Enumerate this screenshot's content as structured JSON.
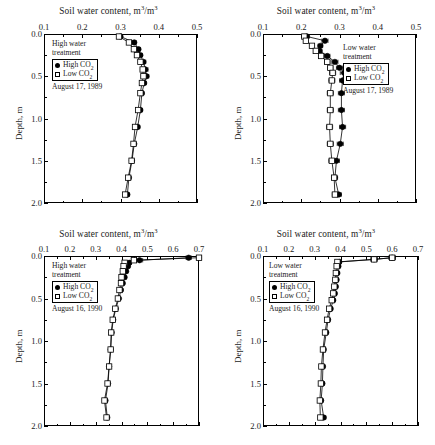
{
  "figure": {
    "axis_title": "Soil water content, m3/m3",
    "axis_title_prefix": "Soil water content, m",
    "axis_title_mid": "/m",
    "superscript": "3",
    "y_axis_label": "Depth, m",
    "legend_high": "High CO",
    "legend_low": "Low CO",
    "legend_sub": "2"
  },
  "chart_data": [
    {
      "type": "line",
      "panel": "top-left",
      "title": "Soil water content, m3/m3",
      "xlabel": "Soil water content, m3/m3",
      "ylabel": "Depth, m",
      "xlim": [
        0.1,
        0.5
      ],
      "ylim": [
        0.0,
        2.0
      ],
      "xticks": [
        0.1,
        0.2,
        0.3,
        0.4,
        0.5
      ],
      "xtick_labels": [
        "0.1",
        "0.2",
        "0.3",
        "0.4",
        "0.5"
      ],
      "yticks": [
        0.0,
        0.5,
        1.0,
        1.5,
        2.0
      ],
      "ytick_labels": [
        "0.0",
        "0.5",
        "1.0",
        "1.5",
        "2.0"
      ],
      "minor_xticks": [
        0.15,
        0.25,
        0.35,
        0.45
      ],
      "minor_yticks": [
        0.25,
        0.75,
        1.25,
        1.75
      ],
      "grid": false,
      "y_inverted": true,
      "annotations": [
        "High water treatment",
        "August 17, 1989"
      ],
      "treatment": "High water treatment",
      "date": "August 17, 1989",
      "series": [
        {
          "name": "High CO2",
          "marker": "filled-circle",
          "depths": [
            0.03,
            0.1,
            0.18,
            0.25,
            0.33,
            0.42,
            0.5,
            0.58,
            0.7,
            0.9,
            1.1,
            1.3,
            1.5,
            1.7,
            1.9
          ],
          "values": [
            0.3,
            0.336,
            0.347,
            0.352,
            0.36,
            0.365,
            0.368,
            0.362,
            0.356,
            0.352,
            0.345,
            0.336,
            0.33,
            0.322,
            0.318
          ],
          "xerr": [
            0.004,
            0.005,
            0.005,
            0.005,
            0.006,
            0.007,
            0.006,
            0.005,
            0.005,
            0.005,
            0.005,
            0.005,
            0.006,
            0.005,
            0.005
          ]
        },
        {
          "name": "Low CO2",
          "marker": "open-square",
          "depths": [
            0.03,
            0.1,
            0.18,
            0.25,
            0.33,
            0.42,
            0.5,
            0.58,
            0.7,
            0.9,
            1.1,
            1.3,
            1.5,
            1.7,
            1.9
          ],
          "values": [
            0.296,
            0.322,
            0.335,
            0.343,
            0.352,
            0.358,
            0.36,
            0.356,
            0.352,
            0.346,
            0.338,
            0.334,
            0.329,
            0.32,
            0.312
          ],
          "xerr": [
            0.004,
            0.005,
            0.005,
            0.005,
            0.005,
            0.006,
            0.006,
            0.005,
            0.005,
            0.005,
            0.005,
            0.005,
            0.005,
            0.005,
            0.005
          ]
        }
      ]
    },
    {
      "type": "line",
      "panel": "top-right",
      "title": "Soil water content, m3/m3",
      "xlabel": "Soil water content, m3/m3",
      "ylabel": "Depth, m",
      "xlim": [
        0.1,
        0.5
      ],
      "ylim": [
        0.0,
        2.0
      ],
      "xticks": [
        0.1,
        0.2,
        0.3,
        0.4,
        0.5
      ],
      "xtick_labels": [
        "0.1",
        "0.2",
        "0.3",
        "0.4",
        "0.5"
      ],
      "yticks": [
        0.0,
        0.5,
        1.0,
        1.5,
        2.0
      ],
      "ytick_labels": [
        "0.0",
        "0.5",
        "1.0",
        "1.5",
        "2.0"
      ],
      "minor_xticks": [
        0.15,
        0.25,
        0.35,
        0.45
      ],
      "minor_yticks": [
        0.25,
        0.75,
        1.25,
        1.75
      ],
      "grid": false,
      "y_inverted": true,
      "annotations": [
        "Low water treatment",
        "August 17, 1989"
      ],
      "treatment": "Low water treatment",
      "date": "August 17, 1989",
      "series": [
        {
          "name": "High CO2",
          "marker": "filled-circle",
          "depths": [
            0.03,
            0.08,
            0.14,
            0.2,
            0.26,
            0.33,
            0.4,
            0.46,
            0.55,
            0.7,
            0.9,
            1.1,
            1.3,
            1.5,
            1.7,
            1.9
          ],
          "values": [
            0.215,
            0.262,
            0.25,
            0.248,
            0.268,
            0.288,
            0.3,
            0.312,
            0.308,
            0.305,
            0.305,
            0.308,
            0.302,
            0.292,
            0.288,
            0.298
          ],
          "xerr": [
            0.005,
            0.008,
            0.006,
            0.006,
            0.007,
            0.008,
            0.008,
            0.01,
            0.008,
            0.008,
            0.008,
            0.008,
            0.008,
            0.008,
            0.007,
            0.007
          ]
        },
        {
          "name": "Low CO2",
          "marker": "open-square",
          "depths": [
            0.03,
            0.08,
            0.14,
            0.2,
            0.26,
            0.33,
            0.4,
            0.46,
            0.55,
            0.7,
            0.9,
            1.1,
            1.3,
            1.5,
            1.7,
            1.9
          ],
          "values": [
            0.208,
            0.212,
            0.228,
            0.238,
            0.252,
            0.268,
            0.276,
            0.282,
            0.28,
            0.276,
            0.276,
            0.274,
            0.276,
            0.28,
            0.286,
            0.288
          ],
          "xerr": [
            0.005,
            0.006,
            0.006,
            0.006,
            0.007,
            0.007,
            0.007,
            0.008,
            0.008,
            0.008,
            0.008,
            0.008,
            0.008,
            0.008,
            0.007,
            0.007
          ]
        }
      ]
    },
    {
      "type": "line",
      "panel": "bottom-left",
      "title": "Soil water content, m3/m3",
      "xlabel": "Soil water content, m3/m3",
      "ylabel": "Depth, m",
      "xlim": [
        0.1,
        0.7
      ],
      "ylim": [
        0.0,
        2.0
      ],
      "xticks": [
        0.1,
        0.2,
        0.3,
        0.4,
        0.5,
        0.6,
        0.7
      ],
      "xtick_labels": [
        "0.1",
        "0.2",
        "0.3",
        "0.4",
        "0.5",
        "0.6",
        "0.7"
      ],
      "yticks": [
        0.0,
        0.5,
        1.0,
        1.5,
        2.0
      ],
      "ytick_labels": [
        "0.0",
        "0.5",
        "1.0",
        "1.5",
        "2.0"
      ],
      "minor_xticks": [
        0.15,
        0.25,
        0.35,
        0.45,
        0.55,
        0.65
      ],
      "minor_yticks": [
        0.25,
        0.75,
        1.25,
        1.75
      ],
      "grid": false,
      "y_inverted": true,
      "annotations": [
        "High water treatment",
        "August 16, 1990"
      ],
      "treatment": "High water treatment",
      "date": "August 16, 1990",
      "series": [
        {
          "name": "High CO2",
          "marker": "filled-circle",
          "depths": [
            0.02,
            0.05,
            0.08,
            0.12,
            0.18,
            0.25,
            0.32,
            0.4,
            0.5,
            0.62,
            0.75,
            0.9,
            1.1,
            1.3,
            1.5,
            1.7,
            1.9
          ],
          "values": [
            0.66,
            0.47,
            0.43,
            0.425,
            0.418,
            0.412,
            0.405,
            0.398,
            0.39,
            0.378,
            0.368,
            0.362,
            0.358,
            0.352,
            0.348,
            0.338,
            0.345
          ],
          "xerr": [
            0.01,
            0.012,
            0.008,
            0.007,
            0.006,
            0.006,
            0.006,
            0.006,
            0.006,
            0.006,
            0.006,
            0.006,
            0.006,
            0.006,
            0.006,
            0.008,
            0.006
          ]
        },
        {
          "name": "Low CO2",
          "marker": "open-square",
          "depths": [
            0.02,
            0.05,
            0.08,
            0.12,
            0.18,
            0.25,
            0.32,
            0.4,
            0.5,
            0.62,
            0.75,
            0.9,
            1.1,
            1.3,
            1.5,
            1.7,
            1.9
          ],
          "values": [
            0.7,
            0.448,
            0.412,
            0.408,
            0.405,
            0.4,
            0.398,
            0.392,
            0.386,
            0.376,
            0.366,
            0.36,
            0.358,
            0.352,
            0.346,
            0.334,
            0.342
          ],
          "xerr": [
            0.01,
            0.01,
            0.007,
            0.006,
            0.006,
            0.006,
            0.006,
            0.006,
            0.006,
            0.006,
            0.006,
            0.006,
            0.006,
            0.006,
            0.006,
            0.007,
            0.006
          ]
        }
      ]
    },
    {
      "type": "line",
      "panel": "bottom-right",
      "title": "Soil water content, m3/m3",
      "xlabel": "Soil water content, m3/m3",
      "ylabel": "Depth, m",
      "xlim": [
        0.1,
        0.7
      ],
      "ylim": [
        0.0,
        2.0
      ],
      "xticks": [
        0.1,
        0.2,
        0.3,
        0.4,
        0.5,
        0.6,
        0.7
      ],
      "xtick_labels": [
        "0.1",
        "0.2",
        "0.3",
        "0.4",
        "0.5",
        "0.6",
        "0.7"
      ],
      "yticks": [
        0.0,
        0.5,
        1.0,
        1.5,
        2.0
      ],
      "ytick_labels": [
        "0.0",
        "0.5",
        "1.0",
        "1.5",
        "2.0"
      ],
      "minor_xticks": [
        0.15,
        0.25,
        0.35,
        0.45,
        0.55,
        0.65
      ],
      "minor_yticks": [
        0.25,
        0.75,
        1.25,
        1.75
      ],
      "grid": false,
      "y_inverted": true,
      "annotations": [
        "Low water treatment",
        "August 16, 1990"
      ],
      "treatment": "Low water treatment",
      "date": "August 16, 1990",
      "series": [
        {
          "name": "High CO2",
          "marker": "filled-circle",
          "depths": [
            0.02,
            0.04,
            0.07,
            0.12,
            0.2,
            0.28,
            0.36,
            0.44,
            0.52,
            0.62,
            0.75,
            0.9,
            1.1,
            1.3,
            1.5,
            1.7,
            1.9
          ],
          "values": [
            0.6,
            0.53,
            0.395,
            0.392,
            0.388,
            0.385,
            0.382,
            0.378,
            0.372,
            0.362,
            0.352,
            0.345,
            0.335,
            0.332,
            0.33,
            0.325,
            0.335
          ],
          "xerr": [
            0.012,
            0.012,
            0.008,
            0.007,
            0.007,
            0.007,
            0.007,
            0.007,
            0.007,
            0.007,
            0.007,
            0.007,
            0.008,
            0.008,
            0.008,
            0.008,
            0.008
          ]
        },
        {
          "name": "Low CO2",
          "marker": "open-square",
          "depths": [
            0.02,
            0.04,
            0.07,
            0.12,
            0.2,
            0.28,
            0.36,
            0.44,
            0.52,
            0.62,
            0.75,
            0.9,
            1.1,
            1.3,
            1.5,
            1.7,
            1.9
          ],
          "values": [
            0.6,
            0.53,
            0.388,
            0.385,
            0.382,
            0.38,
            0.376,
            0.372,
            0.366,
            0.356,
            0.348,
            0.34,
            0.332,
            0.326,
            0.324,
            0.32,
            0.322
          ],
          "xerr": [
            0.012,
            0.012,
            0.007,
            0.007,
            0.007,
            0.007,
            0.007,
            0.007,
            0.007,
            0.007,
            0.007,
            0.007,
            0.008,
            0.008,
            0.008,
            0.008,
            0.008
          ]
        }
      ]
    }
  ]
}
